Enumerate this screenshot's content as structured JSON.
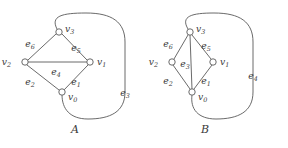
{
  "figure": {
    "background_color": "#ffffff",
    "stroke_color": "#595959",
    "text_color": "#3a3a3a",
    "width": 288,
    "height": 148
  },
  "graphs": [
    {
      "id": "A",
      "caption": "A",
      "caption_x": 75,
      "caption_y": 130,
      "vertices": [
        {
          "id": "v3",
          "name": "v",
          "sub": "3",
          "x": 59,
          "y": 32,
          "r": 3.2,
          "label_x": 65,
          "label_y": 29
        },
        {
          "id": "v2",
          "name": "v",
          "sub": "2",
          "x": 25,
          "y": 62,
          "r": 3.2,
          "label_x": 11,
          "label_y": 62
        },
        {
          "id": "v1",
          "name": "v",
          "sub": "1",
          "x": 90,
          "y": 62,
          "r": 3.2,
          "label_x": 97,
          "label_y": 62
        },
        {
          "id": "v0",
          "name": "v",
          "sub": "0",
          "x": 62,
          "y": 92,
          "r": 3.2,
          "label_x": 68,
          "label_y": 97
        }
      ],
      "edges": [
        {
          "id": "e6",
          "name": "e",
          "sub": "6",
          "from": "v2",
          "to": "v3",
          "path": "M 28 60 L 56 34",
          "label_x": 30,
          "label_y": 44
        },
        {
          "id": "e5",
          "name": "e",
          "sub": "5",
          "from": "v3",
          "to": "v1",
          "path": "M 62 34 L 87 60",
          "label_x": 76,
          "label_y": 48
        },
        {
          "id": "e4",
          "name": "e",
          "sub": "4",
          "from": "v2",
          "to": "v1",
          "path": "M 28 62 L 87 62",
          "label_x": 56,
          "label_y": 72
        },
        {
          "id": "e2",
          "name": "e",
          "sub": "2",
          "from": "v2",
          "to": "v0",
          "path": "M 27 65 L 59 90",
          "label_x": 30,
          "label_y": 82
        },
        {
          "id": "e1",
          "name": "e",
          "sub": "1",
          "from": "v0",
          "to": "v1",
          "path": "M 64 90 L 88 65",
          "label_x": 76,
          "label_y": 82
        },
        {
          "id": "e3",
          "name": "e",
          "sub": "3",
          "from": "v3",
          "to": "v0",
          "path": "M 57 29 C 50 16 62 13 86 13 C 112 13 125 22 125 42 L 125 92 C 125 112 110 119 88 119 C 70 119 62 109 62 95",
          "label_x": 125,
          "label_y": 93
        }
      ]
    },
    {
      "id": "B",
      "caption": "B",
      "caption_x": 205,
      "caption_y": 130,
      "vertices": [
        {
          "id": "v3",
          "name": "v",
          "sub": "3",
          "x": 190,
          "y": 32,
          "r": 3.2,
          "label_x": 196,
          "label_y": 29
        },
        {
          "id": "v2",
          "name": "v",
          "sub": "2",
          "x": 172,
          "y": 62,
          "r": 3.2,
          "label_x": 158,
          "label_y": 62
        },
        {
          "id": "v1",
          "name": "v",
          "sub": "1",
          "x": 213,
          "y": 62,
          "r": 3.2,
          "label_x": 220,
          "label_y": 62
        },
        {
          "id": "v0",
          "name": "v",
          "sub": "0",
          "x": 192,
          "y": 92,
          "r": 3.2,
          "label_x": 198,
          "label_y": 97
        }
      ],
      "edges": [
        {
          "id": "e6",
          "name": "e",
          "sub": "6",
          "from": "v2",
          "to": "v3",
          "path": "M 174 59 L 188 35",
          "label_x": 168,
          "label_y": 44
        },
        {
          "id": "e5",
          "name": "e",
          "sub": "5",
          "from": "v3",
          "to": "v1",
          "path": "M 192 35 L 211 59",
          "label_x": 206,
          "label_y": 46
        },
        {
          "id": "e3",
          "name": "e",
          "sub": "3",
          "from": "v3",
          "to": "v0",
          "path": "M 190 35 L 192 89",
          "label_x": 185,
          "label_y": 64
        },
        {
          "id": "e2",
          "name": "e",
          "sub": "2",
          "from": "v2",
          "to": "v0",
          "path": "M 173 65 L 190 89",
          "label_x": 168,
          "label_y": 81
        },
        {
          "id": "e1",
          "name": "e",
          "sub": "1",
          "from": "v0",
          "to": "v1",
          "path": "M 194 89 L 212 65",
          "label_x": 206,
          "label_y": 81
        },
        {
          "id": "e4",
          "name": "e",
          "sub": "4",
          "from": "v3",
          "to": "v0",
          "path": "M 188 29 C 180 16 192 13 214 13 C 240 13 253 22 253 42 L 253 92 C 253 112 238 119 216 119 C 198 119 190 109 192 95",
          "label_x": 253,
          "label_y": 76
        }
      ]
    }
  ]
}
